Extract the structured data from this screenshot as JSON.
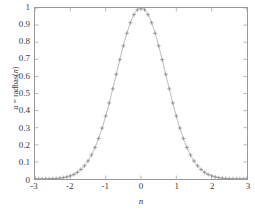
{
  "chart_data": {
    "type": "scatter",
    "title": "",
    "xlabel": "n",
    "ylabel": "a = radbas(n)",
    "ylabel_parts": {
      "a": "a",
      "eq": " = radbas(",
      "n": "n",
      "close": ")"
    },
    "xlim": [
      -3,
      3
    ],
    "ylim": [
      0,
      1
    ],
    "grid": false,
    "legend": null,
    "marker": "+",
    "marker_color": "#8a8a8a",
    "line_color": "#9a9a9a",
    "xticks": [
      -3,
      -2,
      -1,
      0,
      1,
      2,
      3
    ],
    "xtick_labels": [
      "-3",
      "-2",
      "-1",
      "0",
      "1",
      "2",
      "3"
    ],
    "yticks": [
      0,
      0.1,
      0.2,
      0.3,
      0.4,
      0.5,
      0.6,
      0.7,
      0.8,
      0.9,
      1
    ],
    "ytick_labels": [
      "0",
      "0.1",
      "0.2",
      "0.3",
      "0.4",
      "0.5",
      "0.6",
      "0.7",
      "0.8",
      "0.9",
      "1"
    ],
    "function": "exp(-n^2)",
    "x": [
      -3.0,
      -2.9,
      -2.8,
      -2.7,
      -2.6,
      -2.5,
      -2.4,
      -2.3,
      -2.2,
      -2.1,
      -2.0,
      -1.9,
      -1.8,
      -1.7,
      -1.6,
      -1.5,
      -1.4,
      -1.3,
      -1.2,
      -1.1,
      -1.0,
      -0.9,
      -0.8,
      -0.7,
      -0.6,
      -0.5,
      -0.4,
      -0.3,
      -0.2,
      -0.1,
      0.0,
      0.1,
      0.2,
      0.3,
      0.4,
      0.5,
      0.6,
      0.7,
      0.8,
      0.9,
      1.0,
      1.1,
      1.2,
      1.3,
      1.4,
      1.5,
      1.6,
      1.7,
      1.8,
      1.9,
      2.0,
      2.1,
      2.2,
      2.3,
      2.4,
      2.5,
      2.6,
      2.7,
      2.8,
      2.9,
      3.0
    ],
    "y": [
      0.0001,
      0.0002,
      0.0004,
      0.0007,
      0.0012,
      0.0019,
      0.0032,
      0.0051,
      0.0079,
      0.0122,
      0.0183,
      0.027,
      0.0392,
      0.0556,
      0.0773,
      0.1054,
      0.1409,
      0.1845,
      0.2369,
      0.2982,
      0.3679,
      0.4449,
      0.5273,
      0.6126,
      0.6977,
      0.7788,
      0.8521,
      0.9139,
      0.9608,
      0.99,
      1.0,
      0.99,
      0.9608,
      0.9139,
      0.8521,
      0.7788,
      0.6977,
      0.6126,
      0.5273,
      0.4449,
      0.3679,
      0.2982,
      0.2369,
      0.1845,
      0.1409,
      0.1054,
      0.0773,
      0.0556,
      0.0392,
      0.027,
      0.0183,
      0.0122,
      0.0079,
      0.0051,
      0.0032,
      0.0019,
      0.0012,
      0.0007,
      0.0004,
      0.0002,
      0.0001
    ]
  }
}
